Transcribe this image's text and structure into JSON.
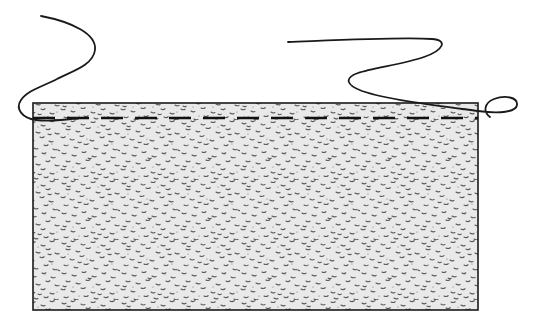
{
  "figure": {
    "width": 540,
    "height": 329,
    "background_color": "#ffffff"
  },
  "soil_block": {
    "name": "stippled soil mass cross-section",
    "x": 33,
    "y": 103,
    "width": 445,
    "height": 207,
    "fill_color": "#e8e8e8",
    "stipple_color": "#4a4a4a",
    "border_color": "#1a1a1a",
    "border_width": 1.6,
    "hatch_pattern": "random-speckle-stipple"
  },
  "water_table_line": {
    "name": "dashed water table line",
    "x1": 33,
    "x2": 478,
    "y": 118,
    "color": "#111111",
    "stroke_width": 2.6,
    "dash_length": 22,
    "gap_length": 12,
    "dash_count": 14
  },
  "curves": [
    {
      "name": "left-squiggle",
      "color": "#1a1a1a",
      "stroke_width": 1.8,
      "path": "M 41 16 C 72 22, 97 34, 95 50 C 93 66, 70 72, 57 79 C 44 86, 28 90, 21 100 C 15 109, 22 118, 36 120 C 50 122, 64 120, 78 118"
    },
    {
      "name": "right-squiggle",
      "color": "#1a1a1a",
      "stroke_width": 1.8,
      "path": "M 288 42 C 340 40, 400 37, 432 39 C 448 40, 444 50, 424 57 C 404 64, 372 68, 358 73 C 344 78, 346 85, 362 91 C 388 100, 440 106, 478 111 C 500 114, 516 112, 517 105 C 518 97, 505 95, 494 99 C 484 103, 483 112, 490 117"
    }
  ],
  "labels": {
    "none_visible": ""
  }
}
